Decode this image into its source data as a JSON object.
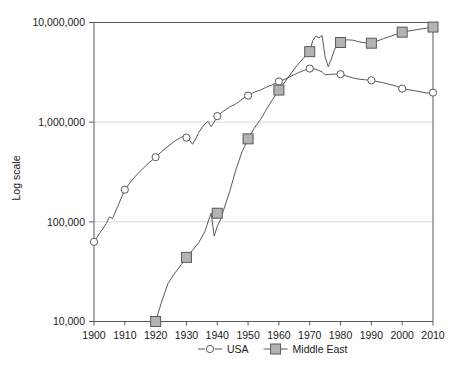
{
  "chart_data": {
    "type": "line",
    "title": "",
    "xlabel": "",
    "ylabel": "Log scale",
    "scale": "log",
    "grid": true,
    "legend_position": "bottom",
    "xlim": [
      1900,
      2010
    ],
    "ylim": [
      10000,
      10000000
    ],
    "xticks": [
      "1900",
      "1910",
      "1920",
      "1930",
      "1940",
      "1950",
      "1960",
      "1970",
      "1980",
      "1990",
      "2000",
      "2010"
    ],
    "yticks": [
      "10,000",
      "100,000",
      "1,000,000",
      "10,000,000"
    ],
    "ytick_values": [
      10000,
      100000,
      1000000,
      10000000
    ],
    "series": [
      {
        "name": "USA",
        "marker": "circle",
        "marker_color": "#ffffff",
        "line_color": "#595959",
        "marker_years": [
          1900,
          1910,
          1920,
          1930,
          1940,
          1950,
          1960,
          1970,
          1980,
          1990,
          2000,
          2010
        ],
        "marker_values": [
          63000,
          210000,
          445000,
          700000,
          1150000,
          1850000,
          2560000,
          3450000,
          3030000,
          2630000,
          2170000,
          1980000
        ],
        "x": [
          1900,
          1902,
          1904,
          1905,
          1906,
          1908,
          1910,
          1912,
          1914,
          1916,
          1918,
          1920,
          1922,
          1924,
          1926,
          1928,
          1930,
          1931,
          1932,
          1933,
          1934,
          1935,
          1936,
          1937,
          1938,
          1939,
          1940,
          1942,
          1944,
          1946,
          1948,
          1950,
          1952,
          1954,
          1956,
          1958,
          1960,
          1962,
          1964,
          1966,
          1968,
          1970,
          1972,
          1974,
          1975,
          1976,
          1978,
          1980,
          1982,
          1984,
          1986,
          1988,
          1990,
          1994,
          1998,
          2000,
          2004,
          2008,
          2010
        ],
        "y": [
          63000,
          78000,
          96000,
          112000,
          108000,
          150000,
          210000,
          255000,
          300000,
          345000,
          395000,
          445000,
          510000,
          570000,
          640000,
          700000,
          740000,
          660000,
          600000,
          680000,
          790000,
          880000,
          960000,
          1020000,
          900000,
          1000000,
          1150000,
          1290000,
          1420000,
          1520000,
          1700000,
          1850000,
          2000000,
          2100000,
          2250000,
          2380000,
          2560000,
          2700000,
          2900000,
          3100000,
          3300000,
          3450000,
          3400000,
          3200000,
          2990000,
          3010000,
          3030000,
          3030000,
          2900000,
          2780000,
          2700000,
          2660000,
          2630000,
          2480000,
          2300000,
          2170000,
          2070000,
          1960000,
          1980000
        ]
      },
      {
        "name": "Middle East",
        "marker": "square",
        "marker_color": "#b3b3b3",
        "line_color": "#595959",
        "marker_years": [
          1920,
          1930,
          1940,
          1950,
          1960,
          1970,
          1980,
          1990,
          2000,
          2010
        ],
        "marker_values": [
          10000,
          44000,
          122000,
          680000,
          2100000,
          5100000,
          6300000,
          6200000,
          8000000,
          9000000
        ],
        "x": [
          1920,
          1922,
          1924,
          1926,
          1928,
          1930,
          1932,
          1934,
          1936,
          1937,
          1938,
          1939,
          1940,
          1941,
          1942,
          1944,
          1946,
          1948,
          1950,
          1952,
          1954,
          1956,
          1958,
          1960,
          1962,
          1964,
          1966,
          1968,
          1970,
          1971,
          1972,
          1973,
          1974,
          1975,
          1976,
          1977,
          1978,
          1979,
          1980,
          1982,
          1984,
          1986,
          1988,
          1990,
          1994,
          1998,
          2000,
          2004,
          2008,
          2010
        ],
        "y": [
          10000,
          16000,
          24000,
          30000,
          36000,
          44000,
          52000,
          62000,
          80000,
          100000,
          122000,
          72000,
          90000,
          105000,
          130000,
          200000,
          330000,
          500000,
          680000,
          870000,
          1060000,
          1350000,
          1700000,
          2100000,
          2550000,
          3100000,
          3750000,
          4400000,
          5100000,
          6600000,
          7300000,
          7000000,
          7400000,
          4500000,
          3600000,
          4300000,
          5300000,
          6100000,
          6300000,
          6700000,
          6650000,
          6400000,
          6250000,
          6200000,
          6900000,
          7600000,
          8000000,
          8400000,
          8800000,
          9000000
        ]
      }
    ]
  },
  "legend": {
    "items": [
      {
        "label": "USA",
        "marker": "circle"
      },
      {
        "label": "Middle East",
        "marker": "square"
      }
    ]
  },
  "colors": {
    "axis": "#595959",
    "grid": "#d9d9d9",
    "line": "#595959",
    "usa_marker_fill": "#ffffff",
    "me_marker_fill": "#b3b3b3",
    "marker_stroke": "#595959",
    "text": "#1a1a1a"
  }
}
